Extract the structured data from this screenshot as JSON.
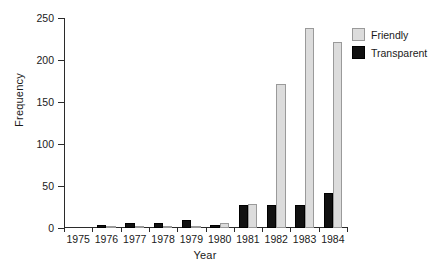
{
  "chart_data": {
    "type": "bar",
    "title": "",
    "subtitle": "",
    "xlabel": "Year",
    "ylabel": "Frequency",
    "categories": [
      "1975",
      "1976",
      "1977",
      "1978",
      "1979",
      "1980",
      "1981",
      "1982",
      "1983",
      "1984"
    ],
    "series": [
      {
        "name": "Transparent",
        "color": "#111111",
        "values": [
          0,
          3,
          6,
          6,
          10,
          3,
          27,
          27,
          27,
          42
        ]
      },
      {
        "name": "Friendly",
        "color": "#dcdcdc",
        "values": [
          0,
          1,
          1,
          2,
          2,
          6,
          28,
          171,
          238,
          222
        ]
      }
    ],
    "ylim": [
      0,
      250
    ],
    "yticks": [
      0,
      50,
      100,
      150,
      200,
      250
    ],
    "ytick_labels": [
      "0",
      "50",
      "100",
      "150",
      "200",
      "250"
    ],
    "grid": false,
    "legend_position": "top-right",
    "legend_entries": [
      "Friendly",
      "Transparent"
    ],
    "bar_order": "Transparent left, Friendly right"
  },
  "legend": {
    "items": [
      {
        "label": "Friendly",
        "swatch": "friendly"
      },
      {
        "label": "Transparent",
        "swatch": "transparent"
      }
    ]
  },
  "corner": {
    "mark": ""
  }
}
